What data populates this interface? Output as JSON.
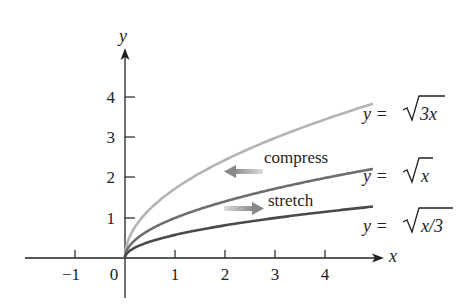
{
  "chart_data": {
    "type": "line",
    "title": "",
    "xlabel": "x",
    "ylabel": "y",
    "xlim": [
      -2,
      5.1
    ],
    "ylim": [
      -1,
      5
    ],
    "grid": false,
    "x_ticks": [
      -1,
      0,
      1,
      2,
      3,
      4
    ],
    "x_tick_labels": [
      "−1",
      "0",
      "1",
      "2",
      "3",
      "4"
    ],
    "y_ticks": [
      1,
      2,
      3,
      4
    ],
    "y_tick_labels": [
      "1",
      "2",
      "3",
      "4"
    ],
    "series": [
      {
        "name": "y = √3x",
        "function": "sqrt(3x)",
        "color": "#b4b4b4",
        "x": [
          0,
          0.5,
          1,
          2,
          3,
          4,
          4.96
        ],
        "values": [
          0,
          1.22,
          1.73,
          2.45,
          3.0,
          3.46,
          3.86
        ]
      },
      {
        "name": "y = √x",
        "function": "sqrt(x)",
        "color": "#6e6e6e",
        "x": [
          0,
          0.5,
          1,
          2,
          3,
          4,
          4.96
        ],
        "values": [
          0,
          0.71,
          1.0,
          1.41,
          1.73,
          2.0,
          2.23
        ]
      },
      {
        "name": "y = √(x/3)",
        "function": "sqrt(x/3)",
        "color": "#4a4a4a",
        "x": [
          0,
          0.5,
          1,
          2,
          3,
          4,
          4.96
        ],
        "values": [
          0,
          0.41,
          0.58,
          0.82,
          1.0,
          1.15,
          1.29
        ]
      }
    ],
    "annotations": [
      {
        "text": "compress",
        "arrow": "left"
      },
      {
        "text": "stretch",
        "arrow": "right"
      }
    ]
  },
  "labels": {
    "x_axis": "x",
    "y_axis": "y",
    "origin": "0",
    "x_ticks": [
      "−1",
      "1",
      "2",
      "3",
      "4"
    ],
    "y_ticks": [
      "1",
      "2",
      "3",
      "4"
    ],
    "compress": "compress",
    "stretch": "stretch",
    "eq_sqrt3x_prefix": "y = ",
    "eq_sqrt3x_radicand": "3x",
    "eq_sqrtx_prefix": "y = ",
    "eq_sqrtx_radicand": "x",
    "eq_sqrtx3_prefix": "y = ",
    "eq_sqrtx3_radicand": "x/3"
  },
  "colors": {
    "axis": "#222222",
    "curve_sqrt3x": "#b4b4b4",
    "curve_sqrtx": "#6e6e6e",
    "curve_sqrtx3": "#4a4a4a",
    "arrow_compress": "#9a9a9a",
    "arrow_stretch": "#9a9a9a"
  }
}
